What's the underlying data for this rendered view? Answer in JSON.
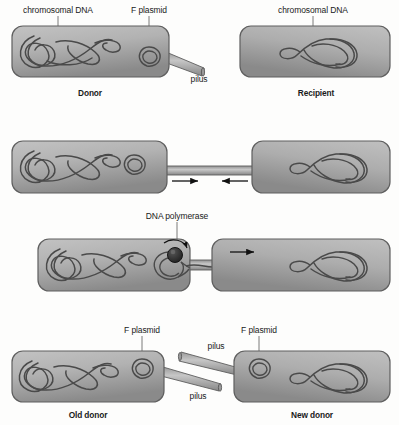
{
  "figure": {
    "panels": [
      {
        "id": "panel-1",
        "labels": {
          "chromosomal_dna_left": "chromosomal DNA",
          "f_plasmid": "F plasmid",
          "pilus": "pilus",
          "chromosomal_dna_right": "chromosomal DNA",
          "cell_left": "Donor",
          "cell_right": "Recipient"
        }
      },
      {
        "id": "panel-2",
        "labels": {
          "arrow_right": "→",
          "arrow_left": "←"
        }
      },
      {
        "id": "panel-3",
        "labels": {
          "dna_polymerase": "DNA polymerase",
          "arrow_right": "→"
        }
      },
      {
        "id": "panel-4",
        "labels": {
          "f_plasmid_left": "F plasmid",
          "f_plasmid_right": "F plasmid",
          "pilus_upper": "pilus",
          "pilus_lower": "pilus",
          "cell_left": "Old donor",
          "cell_right": "New donor"
        }
      }
    ]
  },
  "colors": {
    "background": "#fdfdfc",
    "cell_fill_light": "#b9b9b9",
    "cell_fill_dark": "#8d8d8d",
    "cell_stroke": "#5f5f5f",
    "dna_stroke": "#4a4a4a",
    "plasmid_stroke": "#4a4a4a",
    "pilus_fill_light": "#bdbdbd",
    "pilus_fill_dark": "#8a8a8a",
    "pilus_stroke": "#5d5d5d",
    "polymerase_fill": "#2b2b2b",
    "text": "#1a1a1a",
    "leader_line": "#6b6b6b",
    "arrow": "#111111"
  }
}
